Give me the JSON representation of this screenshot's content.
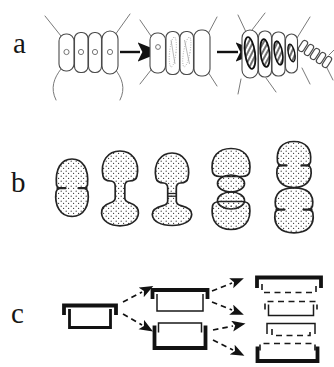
{
  "panels": {
    "a": {
      "label": "a",
      "name": "filament-transformation-sequence"
    },
    "b": {
      "label": "b",
      "name": "cell-division-stages"
    },
    "c": {
      "label": "c",
      "name": "theca-inheritance-scheme"
    }
  },
  "colors": {
    "ink": "#1a1a1a",
    "paper": "#ffffff"
  }
}
